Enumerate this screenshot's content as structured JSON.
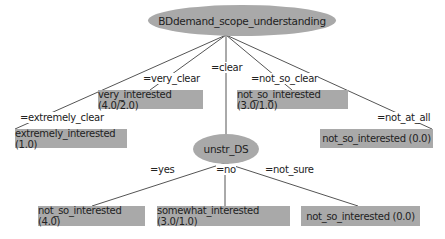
{
  "tree": {
    "root": {
      "label": "BDdemand_scope_understanding",
      "branches": [
        {
          "edge": "=extremely_clear",
          "leaf": "extremely_interested (1.0)"
        },
        {
          "edge": "=very_clear",
          "leaf": "very_interested (4.0/2.0)"
        },
        {
          "edge": "=clear",
          "node": "unstr_DS"
        },
        {
          "edge": "=not_so_clear",
          "leaf": "not_so_interested (3.0/1.0)"
        },
        {
          "edge": "=not_at_all",
          "leaf": "not_so_interested (0.0)"
        }
      ]
    },
    "child": {
      "label": "unstr_DS",
      "branches": [
        {
          "edge": "=yes",
          "leaf": "not_so_interested (4.0)"
        },
        {
          "edge": "=no",
          "leaf": "somewhat_interested (3.0/1.0)"
        },
        {
          "edge": "=not_sure",
          "leaf": "not_so_interested (0.0)"
        }
      ]
    }
  },
  "colors": {
    "node_fill": "#a9a9a9",
    "edge": "#555555",
    "text": "#222222"
  }
}
